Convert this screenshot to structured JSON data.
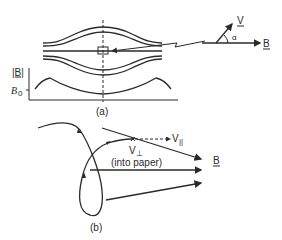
{
  "figure": {
    "panel_a": {
      "caption": "(a)",
      "axis_label_y": "|B|",
      "axis_tick_label": "B",
      "axis_tick_sub": "0",
      "inset": {
        "velocity_label": "V",
        "field_label": "B",
        "angle_label": "α"
      }
    },
    "panel_b": {
      "caption": "(b)",
      "v_parallel_label": "V",
      "v_parallel_sub": "||",
      "v_perp_label": "V",
      "v_perp_sub": "⊥",
      "into_paper_label": "(into paper)",
      "field_label": "B"
    }
  },
  "colors": {
    "ink": "#2a2a2a",
    "background": "#ffffff"
  }
}
